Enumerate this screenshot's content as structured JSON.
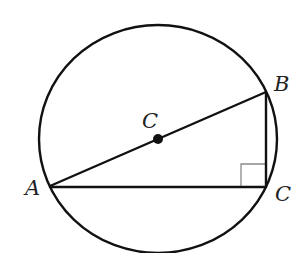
{
  "diagram": {
    "colors": {
      "stroke": "#111111",
      "right_angle_marker": "#8a8a8a",
      "label": "#222222",
      "background": "#ffffff"
    },
    "circle": {
      "label": "C",
      "center": [
        158,
        139
      ],
      "radius": 118
    },
    "points": {
      "A": {
        "label": "A",
        "x": 50,
        "y": 186
      },
      "B": {
        "label": "B",
        "x": 266,
        "y": 92
      },
      "C": {
        "label": "C",
        "x": 266,
        "y": 187
      }
    },
    "segments": [
      "AB",
      "BC",
      "AC"
    ],
    "right_angle_at": "C",
    "labels": {
      "center": "C",
      "A": "A",
      "B": "B",
      "C": "C"
    }
  }
}
